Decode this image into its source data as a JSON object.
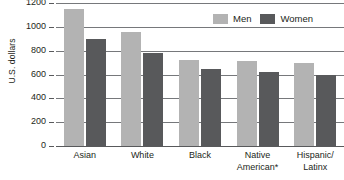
{
  "chart_data": {
    "type": "bar",
    "title": "",
    "xlabel": "",
    "ylabel": "U.S. dollars",
    "ylim": [
      0,
      1200
    ],
    "ytick_values": [
      1200,
      1000,
      800,
      600,
      400,
      200,
      0
    ],
    "ytick_labels": [
      "1200",
      "1000",
      "800",
      "600",
      "400",
      "200",
      "0"
    ],
    "grid": true,
    "legend_position": "top-right",
    "categories": [
      "Asian",
      "White",
      "Black",
      "Native American*",
      "Hispanic/ Latinx"
    ],
    "category_lines": [
      [
        "Asian"
      ],
      [
        "White"
      ],
      [
        "Black"
      ],
      [
        "Native",
        "American*"
      ],
      [
        "Hispanic/",
        "Latinx"
      ]
    ],
    "series": [
      {
        "name": "Men",
        "color": "#b3b3b3",
        "values": [
          1150,
          960,
          720,
          715,
          700
        ]
      },
      {
        "name": "Women",
        "color": "#58595b",
        "values": [
          900,
          780,
          650,
          620,
          600
        ]
      }
    ]
  },
  "legend": {
    "items": [
      {
        "label": "Men",
        "color": "#b3b3b3"
      },
      {
        "label": "Women",
        "color": "#58595b"
      }
    ]
  },
  "axis": {
    "y_title": "U.S. dollars"
  },
  "colors": {
    "men": "#b3b3b3",
    "women": "#58595b",
    "gridline": "#76787b",
    "baseline": "#58595b",
    "text": "#231f20",
    "background": "#ffffff"
  }
}
